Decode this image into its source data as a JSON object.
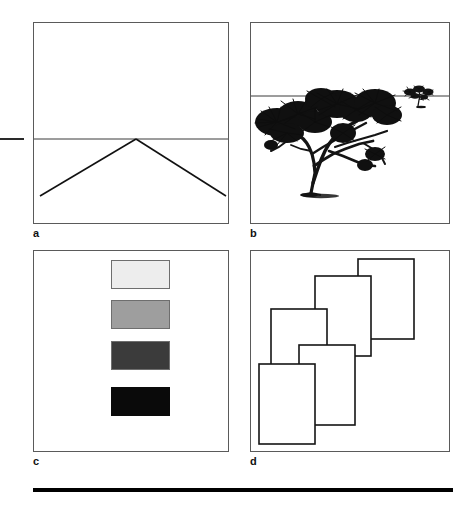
{
  "figure": {
    "background_color": "#ffffff",
    "width": 473,
    "height": 510
  },
  "panels": [
    {
      "id": "a",
      "label": "a",
      "cue_name": "linear-perspective",
      "x": 33,
      "y": 22,
      "width": 196,
      "height": 202,
      "horizon_y_ratio": 0.575,
      "vanishing_point_x_ratio": 0.52,
      "road_left_x_ratio": 0.04,
      "road_right_x_ratio": 0.98,
      "road_bottom_y_ratio": 0.855,
      "border_color": "#5a5a5a",
      "line_color": "#1a1a1a"
    },
    {
      "id": "b",
      "label": "b",
      "cue_name": "relative-size",
      "x": 250,
      "y": 22,
      "width": 200,
      "height": 202,
      "horizon_y_ratio": 0.36,
      "border_color": "#5a5a5a",
      "line_color": "#1a1a1a",
      "near_tree": {
        "cx_ratio": 0.37,
        "base_y_ratio": 0.86,
        "scale": 1.0
      },
      "far_tree": {
        "cx_ratio": 0.86,
        "base_y_ratio": 0.42,
        "scale": 0.15
      }
    },
    {
      "id": "c",
      "label": "c",
      "cue_name": "aerial-perspective-brightness",
      "x": 33,
      "y": 250,
      "width": 196,
      "height": 202,
      "border_color": "#5a5a5a",
      "swatches": [
        {
          "name": "swatch-lightest",
          "color": "#ededed",
          "x_ratio": 0.395,
          "y_ratio": 0.045,
          "w_ratio": 0.3,
          "h_ratio": 0.145
        },
        {
          "name": "swatch-light-gray",
          "color": "#9e9e9e",
          "x_ratio": 0.395,
          "y_ratio": 0.245,
          "w_ratio": 0.3,
          "h_ratio": 0.145
        },
        {
          "name": "swatch-dark-gray",
          "color": "#3b3b3b",
          "x_ratio": 0.395,
          "y_ratio": 0.445,
          "w_ratio": 0.3,
          "h_ratio": 0.145
        },
        {
          "name": "swatch-black",
          "color": "#0a0a0a",
          "x_ratio": 0.395,
          "y_ratio": 0.675,
          "w_ratio": 0.3,
          "h_ratio": 0.145
        }
      ]
    },
    {
      "id": "d",
      "label": "d",
      "cue_name": "interposition-occlusion",
      "x": 250,
      "y": 250,
      "width": 200,
      "height": 202,
      "border_color": "#5a5a5a",
      "line_color": "#1a1a1a",
      "rectangles": [
        {
          "name": "card-back",
          "x": 107,
          "y": 8,
          "w": 56,
          "h": 80,
          "z": 1
        },
        {
          "name": "card-mid-upper",
          "x": 64,
          "y": 25,
          "w": 56,
          "h": 80,
          "z": 2
        },
        {
          "name": "card-mid-lower",
          "x": 20,
          "y": 58,
          "w": 56,
          "h": 80,
          "z": 3
        },
        {
          "name": "card-front-right",
          "x": 48,
          "y": 94,
          "w": 56,
          "h": 80,
          "z": 4
        },
        {
          "name": "card-front-left",
          "x": 8,
          "y": 113,
          "w": 56,
          "h": 80,
          "z": 5
        }
      ]
    }
  ],
  "decorations": {
    "left_tick": {
      "name": "left-margin-tick",
      "x": 0,
      "y": 138,
      "width": 24,
      "height": 2,
      "color": "#2a2a2a"
    },
    "bottom_rule": {
      "name": "bottom-rule",
      "x": 33,
      "y": 488,
      "width": 420,
      "height": 4,
      "color": "#000000"
    }
  }
}
